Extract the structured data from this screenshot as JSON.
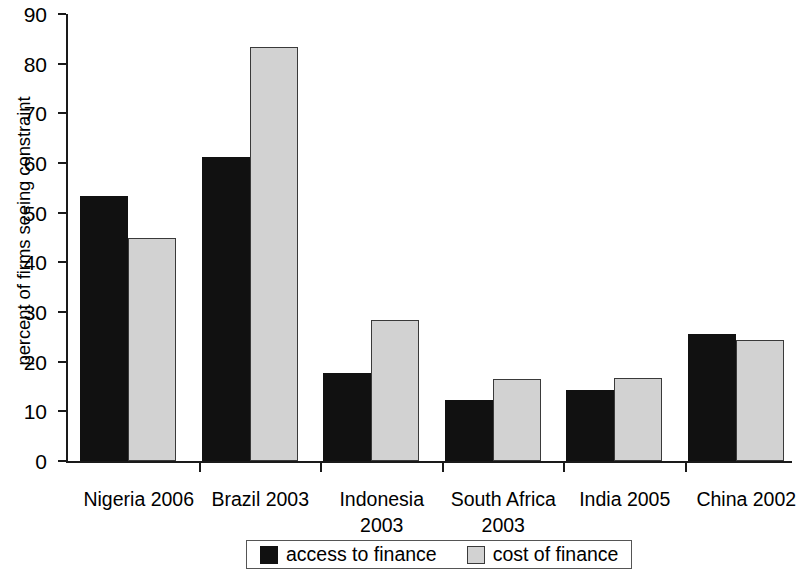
{
  "chart_data": {
    "type": "bar",
    "title": "",
    "subtitle": "",
    "xlabel": "",
    "ylabel": "percent of firms seeing constraint",
    "categories": [
      "Nigeria 2006",
      "Brazil 2003",
      "Indonesia\n2003",
      "South Africa\n2003",
      "India 2005",
      "China 2002"
    ],
    "series": [
      {
        "name": "access to finance",
        "color": "#111111",
        "values": [
          53.3,
          61.3,
          17.8,
          12.3,
          14.3,
          25.6
        ]
      },
      {
        "name": "cost of finance",
        "color": "#d2d2d2",
        "values": [
          44.9,
          83.4,
          28.4,
          16.5,
          16.7,
          24.3
        ]
      }
    ],
    "ylim": [
      0,
      90
    ],
    "yticks": [
      0,
      10,
      20,
      30,
      40,
      50,
      60,
      70,
      80,
      90
    ],
    "ytick_labels": [
      "0",
      "10",
      "20",
      "30",
      "40",
      "50",
      "60",
      "70",
      "80",
      "90"
    ],
    "grid": false,
    "legend_position": "bottom-center"
  },
  "legend": {
    "entries": [
      {
        "label": "access to finance",
        "swatch": "black-square-swatch"
      },
      {
        "label": "cost of finance",
        "swatch": "gray-square-swatch"
      }
    ]
  }
}
